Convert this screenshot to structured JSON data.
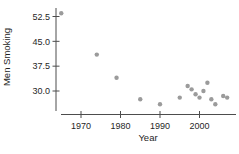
{
  "figure": {
    "background": "#ffffff"
  },
  "chart_data": {
    "type": "scatter",
    "title": "",
    "xlabel": "Year",
    "ylabel": "Men Smoking",
    "x_ticks": [
      1970,
      1980,
      1990,
      2000
    ],
    "x_tick_labels": [
      "1970",
      "1980",
      "1990",
      "2000"
    ],
    "y_ticks": [
      52.5,
      45.0,
      37.5,
      30.0
    ],
    "y_tick_labels": [
      "52.5",
      "45.0",
      "37.5",
      "30.0"
    ],
    "xlim": [
      1963.7,
      2009.5
    ],
    "ylim": [
      24,
      55.5
    ],
    "grid": false,
    "legend": null,
    "point_color": "#9b9b9b",
    "axis_color": "#4d4d4d",
    "label_color": "#1f1f1f",
    "points": [
      {
        "x": 1965,
        "y": 53.5
      },
      {
        "x": 1974,
        "y": 41.0
      },
      {
        "x": 1979,
        "y": 34.0
      },
      {
        "x": 1985,
        "y": 27.5
      },
      {
        "x": 1990,
        "y": 26.0
      },
      {
        "x": 1995,
        "y": 28.0
      },
      {
        "x": 1997,
        "y": 31.5
      },
      {
        "x": 1998,
        "y": 30.5
      },
      {
        "x": 1999,
        "y": 29.0
      },
      {
        "x": 2000,
        "y": 28.0
      },
      {
        "x": 2001,
        "y": 30.0
      },
      {
        "x": 2002,
        "y": 32.5
      },
      {
        "x": 2003,
        "y": 27.5
      },
      {
        "x": 2004,
        "y": 26.0
      },
      {
        "x": 2006,
        "y": 28.5
      },
      {
        "x": 2007,
        "y": 28.0
      }
    ]
  }
}
